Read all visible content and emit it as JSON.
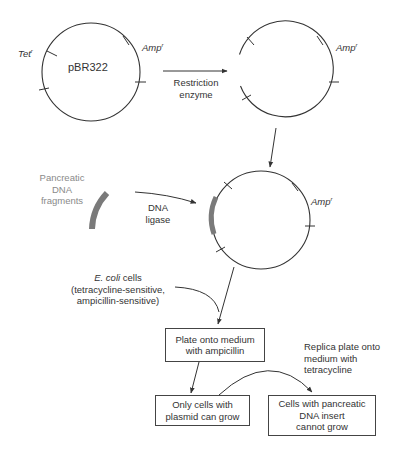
{
  "caption": "plasmid vector for cloning in E. coli",
  "plasmid_original": {
    "name": "pBR322",
    "tet_gene": "Tet",
    "amp_gene": "Amp",
    "resistance_superscript": "r"
  },
  "step1": {
    "arrow_label_line1": "Restriction",
    "arrow_label_line2": "enzyme"
  },
  "plasmid_cut": {
    "amp_gene": "Amp",
    "resistance_superscript": "r"
  },
  "insert": {
    "label_line1": "Pancreatic",
    "label_line2": "DNA",
    "label_line3": "fragments",
    "fragment_color": "#7a7a7a"
  },
  "step2": {
    "arrow_label_line1": "DNA",
    "arrow_label_line2": "ligase"
  },
  "plasmid_recombinant": {
    "amp_gene": "Amp",
    "resistance_superscript": "r"
  },
  "ecoli": {
    "name": "E. coli",
    "suffix": " cells",
    "line2": "(tetracycline-sensitive,",
    "line3": "ampicillin-sensitive)"
  },
  "boxes": {
    "plate_ampicillin_line1": "Plate onto medium",
    "plate_ampicillin_line2": "with ampicillin",
    "only_plasmid_line1": "Only cells with",
    "only_plasmid_line2": "plasmid can grow",
    "insert_cannot_line1": "Cells with pancreatic",
    "insert_cannot_line2": "DNA insert",
    "insert_cannot_line3": "cannot grow"
  },
  "replica": {
    "line1": "Replica plate onto",
    "line2": "medium with",
    "line3": "tetracycline"
  }
}
